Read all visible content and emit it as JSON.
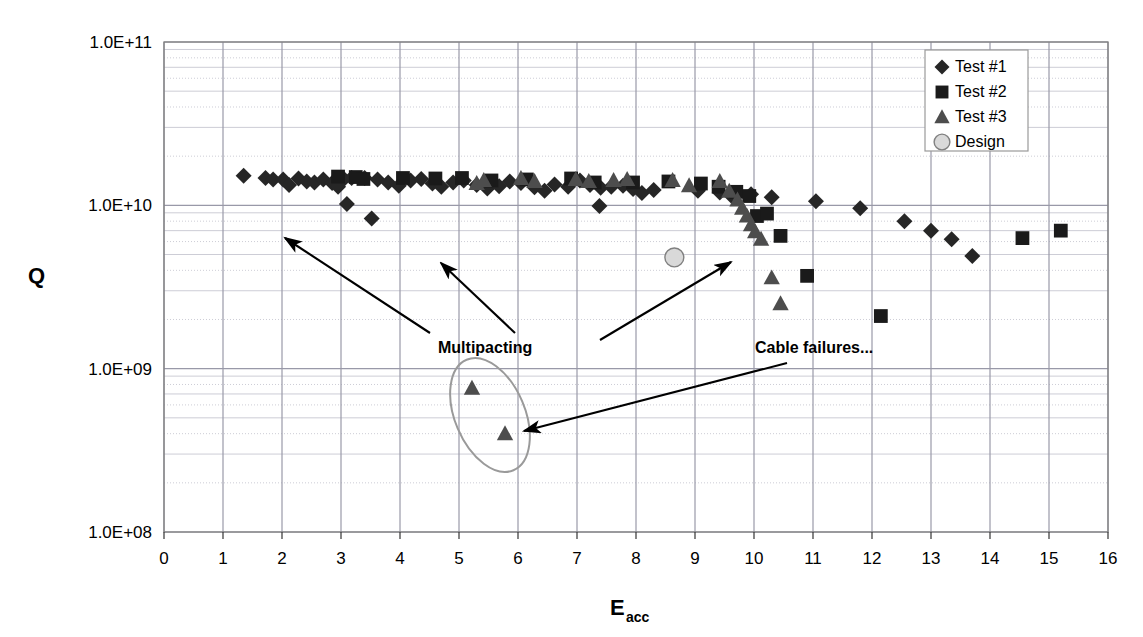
{
  "chart_data": {
    "type": "scatter",
    "title": "",
    "xlabel": "E",
    "xlabel_sub": "acc",
    "ylabel": "Q",
    "xlim": [
      0,
      16
    ],
    "ylim": [
      100000000.0,
      100000000000.0
    ],
    "yscale": "log",
    "xticks": [
      "0",
      "1",
      "2",
      "3",
      "4",
      "5",
      "6",
      "7",
      "8",
      "9",
      "10",
      "11",
      "12",
      "13",
      "14",
      "15",
      "16"
    ],
    "yticks": [
      "1.0E+08",
      "1.0E+09",
      "1.0E+10",
      "1.0E+11"
    ],
    "grid": true,
    "legend_position": "top-right",
    "series": [
      {
        "name": "Test #1",
        "marker": "diamond",
        "color": "#262626",
        "points": [
          [
            1.35,
            15200000000.0
          ],
          [
            1.72,
            14700000000.0
          ],
          [
            1.85,
            14400000000.0
          ],
          [
            2.02,
            14400000000.0
          ],
          [
            2.12,
            13300000000.0
          ],
          [
            2.28,
            14600000000.0
          ],
          [
            2.42,
            14000000000.0
          ],
          [
            2.55,
            13800000000.0
          ],
          [
            2.7,
            14400000000.0
          ],
          [
            2.85,
            13700000000.0
          ],
          [
            2.95,
            13000000000.0
          ],
          [
            3.05,
            14500000000.0
          ],
          [
            3.18,
            14700000000.0
          ],
          [
            3.1,
            10200000000.0
          ],
          [
            3.52,
            8300000000.0
          ],
          [
            3.4,
            14700000000.0
          ],
          [
            3.62,
            14400000000.0
          ],
          [
            3.8,
            13800000000.0
          ],
          [
            3.98,
            13200000000.0
          ],
          [
            4.18,
            14200000000.0
          ],
          [
            4.36,
            14500000000.0
          ],
          [
            4.55,
            13600000000.0
          ],
          [
            4.7,
            13000000000.0
          ],
          [
            4.9,
            13800000000.0
          ],
          [
            5.08,
            14200000000.0
          ],
          [
            5.3,
            13300000000.0
          ],
          [
            5.48,
            12700000000.0
          ],
          [
            5.68,
            13100000000.0
          ],
          [
            5.86,
            14000000000.0
          ],
          [
            6.05,
            13700000000.0
          ],
          [
            6.28,
            12900000000.0
          ],
          [
            6.45,
            12300000000.0
          ],
          [
            6.62,
            13400000000.0
          ],
          [
            6.85,
            13000000000.0
          ],
          [
            7.05,
            14200000000.0
          ],
          [
            7.22,
            13300000000.0
          ],
          [
            7.4,
            12800000000.0
          ],
          [
            7.38,
            9900000000.0
          ],
          [
            7.58,
            13000000000.0
          ],
          [
            7.78,
            13200000000.0
          ],
          [
            7.95,
            12600000000.0
          ],
          [
            8.1,
            11900000000.0
          ],
          [
            8.3,
            12400000000.0
          ],
          [
            9.05,
            12300000000.0
          ],
          [
            9.42,
            12000000000.0
          ],
          [
            9.62,
            11400000000.0
          ],
          [
            9.95,
            11700000000.0
          ],
          [
            10.3,
            11200000000.0
          ],
          [
            11.05,
            10600000000.0
          ],
          [
            11.8,
            9600000000.0
          ],
          [
            12.55,
            8000000000.0
          ],
          [
            13.0,
            7000000000.0
          ],
          [
            13.35,
            6200000000.0
          ],
          [
            13.7,
            4900000000.0
          ]
        ]
      },
      {
        "name": "Test #2",
        "marker": "square",
        "color": "#1a1a1a",
        "points": [
          [
            2.95,
            15000000000.0
          ],
          [
            3.25,
            14900000000.0
          ],
          [
            3.38,
            14500000000.0
          ],
          [
            4.05,
            14700000000.0
          ],
          [
            4.6,
            14600000000.0
          ],
          [
            5.05,
            14700000000.0
          ],
          [
            5.55,
            14200000000.0
          ],
          [
            6.15,
            14400000000.0
          ],
          [
            6.9,
            14600000000.0
          ],
          [
            7.3,
            13800000000.0
          ],
          [
            7.95,
            13800000000.0
          ],
          [
            8.55,
            14000000000.0
          ],
          [
            9.1,
            13600000000.0
          ],
          [
            9.4,
            13000000000.0
          ],
          [
            9.7,
            12100000000.0
          ],
          [
            9.92,
            11400000000.0
          ],
          [
            10.05,
            8600000000.0
          ],
          [
            10.22,
            8900000000.0
          ],
          [
            10.45,
            6500000000.0
          ],
          [
            10.9,
            3700000000.0
          ],
          [
            12.15,
            2100000000.0
          ],
          [
            14.55,
            6300000000.0
          ],
          [
            15.2,
            7000000000.0
          ]
        ]
      },
      {
        "name": "Test #3",
        "marker": "triangle",
        "color": "#4d4d4d",
        "points": [
          [
            5.3,
            13600000000.0
          ],
          [
            5.42,
            14200000000.0
          ],
          [
            6.05,
            14600000000.0
          ],
          [
            6.28,
            14000000000.0
          ],
          [
            6.98,
            14400000000.0
          ],
          [
            7.2,
            14000000000.0
          ],
          [
            7.62,
            14200000000.0
          ],
          [
            7.85,
            14400000000.0
          ],
          [
            8.62,
            14200000000.0
          ],
          [
            8.9,
            13200000000.0
          ],
          [
            9.42,
            14000000000.0
          ],
          [
            9.58,
            12200000000.0
          ],
          [
            9.72,
            10800000000.0
          ],
          [
            9.8,
            9600000000.0
          ],
          [
            9.88,
            8600000000.0
          ],
          [
            9.95,
            7600000000.0
          ],
          [
            10.02,
            6900000000.0
          ],
          [
            10.12,
            6200000000.0
          ],
          [
            10.3,
            3600000000.0
          ],
          [
            10.45,
            2500000000.0
          ],
          [
            5.22,
            760000000.0
          ],
          [
            5.78,
            400000000.0
          ]
        ]
      },
      {
        "name": "Design",
        "marker": "circle",
        "color": "#d9d9d9",
        "points": [
          [
            8.65,
            4800000000.0
          ]
        ]
      }
    ],
    "annotations": [
      {
        "text": "Multipacting",
        "x": 438,
        "y": 347
      },
      {
        "text": "Cable failures...",
        "x": 755,
        "y": 347
      }
    ]
  },
  "legend": {
    "items": [
      {
        "label": "Test #1",
        "marker": "diamond"
      },
      {
        "label": "Test #2",
        "marker": "square"
      },
      {
        "label": "Test #3",
        "marker": "triangle"
      },
      {
        "label": "Design",
        "marker": "circle"
      }
    ]
  },
  "colors": {
    "plot_border": "#808080",
    "major_grid": "#9999a8",
    "minor_grid": "#c0c0cc",
    "background": "#ffffff",
    "text": "#000000"
  }
}
